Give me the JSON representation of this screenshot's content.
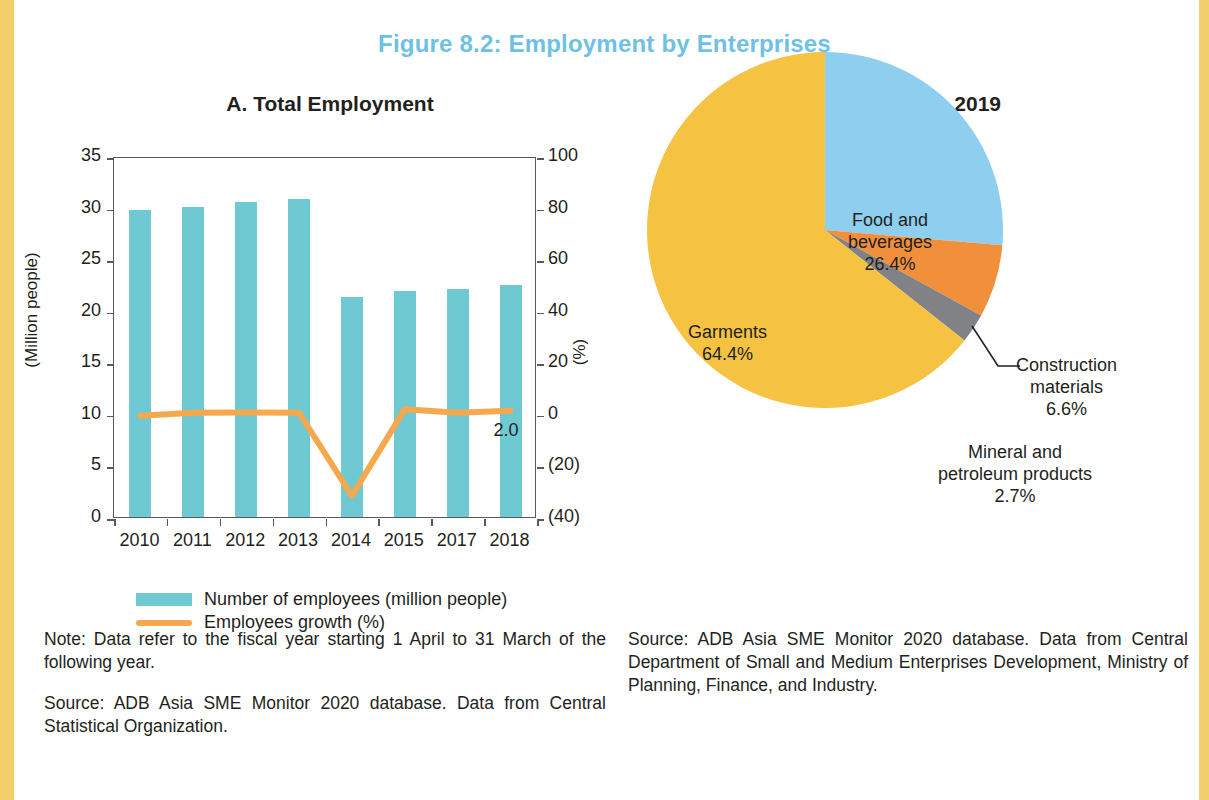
{
  "figure": {
    "title": "Figure 8.2: Employment by Enterprises",
    "title_color": "#6ec1e4"
  },
  "panel_a": {
    "title": "A. Total Employment",
    "y_left_title": "(Million people)",
    "y_right_title": "(%)",
    "legend": [
      {
        "label": "Number of employees (million people)",
        "type": "bar",
        "color": "#6ec9d2"
      },
      {
        "label": "Employees growth (%)",
        "type": "line",
        "color": "#f5a84e"
      }
    ],
    "annotation": "2.0"
  },
  "panel_b": {
    "title": "B. By Sector, 2019"
  },
  "footnotes": {
    "note_left": "Note: Data refer to the fiscal year starting 1 April to 31 March of the following year.",
    "source_left": "Source: ADB Asia SME Monitor 2020 database. Data from Central Statistical Organization.",
    "source_right": "Source: ADB Asia SME Monitor 2020 database. Data from Central Department of Small and Medium Enterprises Development, Ministry of Planning, Finance, and Industry."
  },
  "chart_data": [
    {
      "type": "bar",
      "title": "A. Total Employment",
      "xlabel": "",
      "ylabel": "(Million people)",
      "y2label": "(%)",
      "categories": [
        "2010",
        "2011",
        "2012",
        "2013",
        "2014",
        "2015",
        "2017",
        "2018"
      ],
      "ylim": [
        0,
        35
      ],
      "yticks": [
        0,
        5,
        10,
        15,
        20,
        25,
        30,
        35
      ],
      "ytick_labels": [
        "0",
        "5",
        "10",
        "15",
        "20",
        "25",
        "30",
        "35"
      ],
      "y2lim": [
        -40,
        100
      ],
      "y2ticks": [
        -40,
        -20,
        0,
        20,
        40,
        60,
        80,
        100
      ],
      "y2tick_labels": [
        "(40)",
        "(20)",
        "0",
        "20",
        "40",
        "60",
        "80",
        "100"
      ],
      "grid": false,
      "legend_position": "bottom-left",
      "series": [
        {
          "name": "Number of employees (million people)",
          "type": "bar",
          "axis": "left",
          "color": "#6ec9d2",
          "values": [
            29.8,
            30.1,
            30.5,
            30.8,
            21.3,
            21.9,
            22.1,
            22.5
          ]
        },
        {
          "name": "Employees growth (%)",
          "type": "line",
          "axis": "right",
          "color": "#f5a84e",
          "values": [
            0.0,
            1.2,
            1.3,
            1.2,
            -31.0,
            2.6,
            1.2,
            2.0
          ],
          "data_labels": [
            null,
            null,
            null,
            null,
            null,
            null,
            null,
            "2.0"
          ]
        }
      ]
    },
    {
      "type": "pie",
      "title": "B. By Sector, 2019",
      "labels": [
        "Food and beverages",
        "Construction materials",
        "Mineral and petroleum products",
        "Garments"
      ],
      "values": [
        26.4,
        6.6,
        2.7,
        64.4
      ],
      "value_labels": [
        "26.4%",
        "6.6%",
        "2.7%",
        "64.4%"
      ],
      "colors": [
        "#8ecff0",
        "#f18f3b",
        "#808285",
        "#f5c242"
      ],
      "label_placement": [
        "inside",
        "outside",
        "outside-leader",
        "inside"
      ],
      "start_angle_deg": 0,
      "direction": "clockwise"
    }
  ]
}
